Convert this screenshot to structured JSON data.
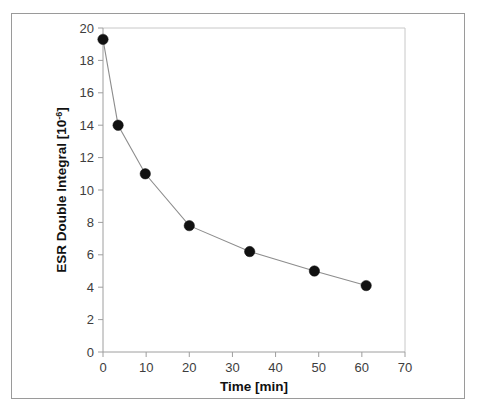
{
  "chart_data": {
    "type": "line",
    "title": "",
    "subtitle": "",
    "xlabel": "Time [min]",
    "ylabel_text": "ESR Double Integral [10",
    "ylabel_sup": "-6",
    "ylabel_tail": "]",
    "ylabel_full": "ESR Double Integral [10-6]",
    "xlim": [
      0,
      70
    ],
    "ylim": [
      0,
      20
    ],
    "xticks": [
      0,
      10,
      20,
      30,
      40,
      50,
      60,
      70
    ],
    "yticks": [
      0,
      2,
      4,
      6,
      8,
      10,
      12,
      14,
      16,
      18,
      20
    ],
    "xticklabels": [
      "0",
      "10",
      "20",
      "30",
      "40",
      "50",
      "60",
      "70"
    ],
    "yticklabels": [
      "0",
      "2",
      "4",
      "6",
      "8",
      "10",
      "12",
      "14",
      "16",
      "18",
      "20"
    ],
    "grid": false,
    "legend": null,
    "marker": "filled-circle",
    "marker_color": "#111111",
    "line_color": "#8d8d8d",
    "series": [
      {
        "name": "ESR double integral decay",
        "x": [
          0,
          3.5,
          9.8,
          20.0,
          34.0,
          49.0,
          61.0
        ],
        "y": [
          19.3,
          14.0,
          11.0,
          7.8,
          6.2,
          5.0,
          4.1
        ]
      }
    ]
  },
  "figure": {
    "border_color": "#9a9a9a",
    "background": "#ffffff",
    "axis_color": "#9e9e9e",
    "text_color": "#3d3d3d"
  }
}
